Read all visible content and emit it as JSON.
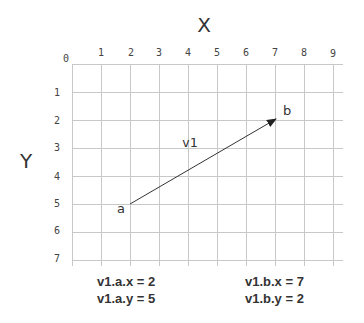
{
  "diagram": {
    "x_axis_title": "X",
    "y_axis_title": "Y",
    "x_ticks": [
      "0",
      "1",
      "2",
      "3",
      "4",
      "5",
      "6",
      "7",
      "8",
      "9"
    ],
    "y_ticks": [
      "1",
      "2",
      "3",
      "4",
      "5",
      "6",
      "7"
    ],
    "grid_color": "#c8c8c8",
    "vector": {
      "label": "v1",
      "start": {
        "label": "a",
        "x": 2,
        "y": 5
      },
      "end": {
        "label": "b",
        "x": 7,
        "y": 2
      },
      "color": "#333333"
    },
    "annotations": {
      "a_x": "v1.a.x = 2",
      "a_y": "v1.a.y = 5",
      "b_x": "v1.b.x = 7",
      "b_y": "v1.b.y = 2"
    }
  }
}
